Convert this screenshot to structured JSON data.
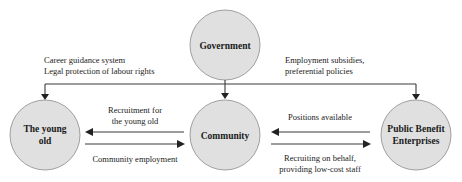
{
  "diagram": {
    "type": "flow-relationship",
    "colors": {
      "node_fill": "#e0e0e0",
      "node_stroke": "#8a8a8a",
      "line": "#3a3a3a",
      "text": "#1a1a1a"
    },
    "nodes": {
      "government": {
        "lines": [
          "Government"
        ]
      },
      "young_old": {
        "lines": [
          "The young",
          "old"
        ]
      },
      "community": {
        "lines": [
          "Community"
        ]
      },
      "pbe": {
        "lines": [
          "Public Benefit",
          "Enterprises"
        ]
      }
    },
    "labels": {
      "gov_to_young_old": [
        "Career guidance system",
        "Legal protection of labour rights"
      ],
      "gov_to_pbe": [
        "Employment subsidies,",
        "preferential policies"
      ],
      "community_to_young_old": [
        "Recruitment for",
        "the young old"
      ],
      "young_old_to_community": [
        "Community employment"
      ],
      "pbe_to_community": [
        "Positions available"
      ],
      "community_to_pbe": [
        "Recruiting on behalf,",
        "providing low-cost staff"
      ]
    }
  }
}
